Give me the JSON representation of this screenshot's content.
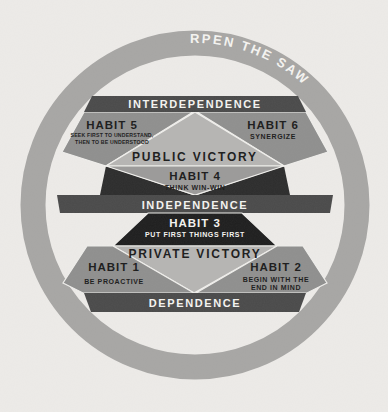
{
  "colors": {
    "background": "#edebe8",
    "ring": "#a7a6a4",
    "level_bar": "#4a4a4a",
    "habit_region": "#8f8f8e",
    "victory_region": "#b6b5b3",
    "habit4_region": "#9b9a99",
    "habit3_region": "#1e1e1e",
    "wedge": "#2c2c2c",
    "text_dark": "#1b1b1b",
    "text_light": "#f5f4f1"
  },
  "ring": {
    "habit": "HABIT 7",
    "name": "SHARPEN THE SAW"
  },
  "levels": {
    "interdependence": "INTERDEPENDENCE",
    "independence": "INDEPENDENCE",
    "dependence": "DEPENDENCE"
  },
  "victories": {
    "public": "PUBLIC VICTORY",
    "private": "PRIVATE VICTORY"
  },
  "habits": {
    "h1": {
      "title": "HABIT 1",
      "subtitle": "BE PROACTIVE"
    },
    "h2": {
      "title": "HABIT 2",
      "subtitle_line1": "BEGIN WITH THE",
      "subtitle_line2": "END IN MIND"
    },
    "h3": {
      "title": "HABIT 3",
      "subtitle": "PUT FIRST THINGS FIRST"
    },
    "h4": {
      "title": "HABIT 4",
      "subtitle": "THINK WIN-WIN"
    },
    "h5": {
      "title": "HABIT 5",
      "subtitle_line1": "SEEK FIRST TO UNDERSTAND,",
      "subtitle_line2": "THEN TO BE UNDERSTOOD"
    },
    "h6": {
      "title": "HABIT 6",
      "subtitle": "SYNERGIZE"
    }
  }
}
